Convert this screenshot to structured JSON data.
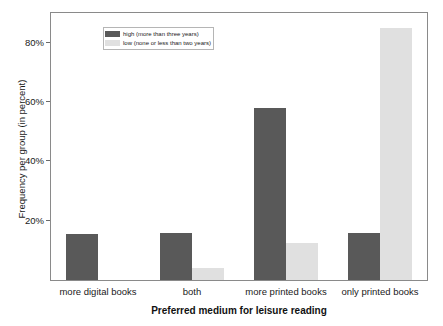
{
  "chart_data": {
    "type": "bar",
    "title": "",
    "subtitle": "",
    "xlabel": "Preferred medium for leisure reading",
    "ylabel": "Frequency per group (in percent)",
    "categories": [
      "more digital books",
      "both",
      "more printed books",
      "only printed books"
    ],
    "series": [
      {
        "name": "high (more than three years)",
        "color": "#595959",
        "values": [
          15.5,
          15.7,
          58.0,
          16.0
        ]
      },
      {
        "name": "low (none or less than two years)",
        "color": "#e0e0e0",
        "values": [
          0.0,
          4.0,
          12.5,
          85.0
        ]
      }
    ],
    "ylim": [
      0,
      90
    ],
    "yticks": [
      20,
      40,
      60,
      80
    ],
    "ytick_labels": [
      "20%",
      "40%",
      "60%",
      "80%"
    ],
    "grid": false,
    "legend_position": "upper left",
    "background": "#ffffff",
    "frame_color": "#8a8a8a"
  },
  "legend": {
    "items": [
      {
        "label": "high (more than three years)"
      },
      {
        "label": "low (none or less than two years)"
      }
    ]
  }
}
